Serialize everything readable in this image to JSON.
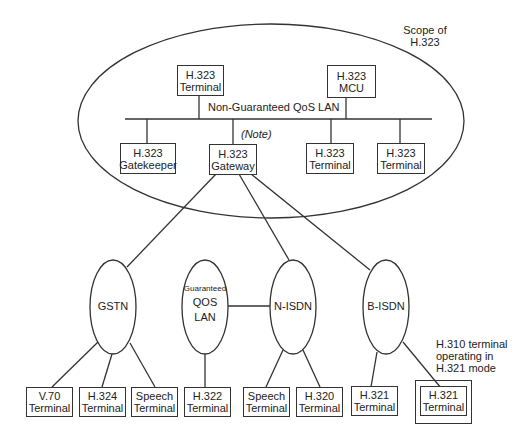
{
  "scope_label": {
    "line1": "Scope of",
    "line2": "H.323"
  },
  "lan_label": "Non-Guaranteed QoS LAN",
  "note_label": "(Note)",
  "h323_nodes": {
    "terminal_top": {
      "line1": "H.323",
      "line2": "Terminal"
    },
    "mcu": {
      "line1": "H.323",
      "line2": "MCU"
    },
    "gatekeeper": {
      "line1": "H.323",
      "line2": "Gatekeeper"
    },
    "gateway": {
      "line1": "H.323",
      "line2": "Gateway"
    },
    "terminal_a": {
      "line1": "H.323",
      "line2": "Terminal"
    },
    "terminal_b": {
      "line1": "H.323",
      "line2": "Terminal"
    }
  },
  "networks": {
    "gstn": "GSTN",
    "gqos": {
      "line1": "Guaranteed",
      "line2": "QOS",
      "line3": "LAN"
    },
    "nisdn": "N-ISDN",
    "bisdn": "B-ISDN"
  },
  "terminals": [
    {
      "line1": "V.70",
      "line2": "Terminal"
    },
    {
      "line1": "H.324",
      "line2": "Terminal"
    },
    {
      "line1": "Speech",
      "line2": "Terminal"
    },
    {
      "line1": "H.322",
      "line2": "Terminal"
    },
    {
      "line1": "Speech",
      "line2": "Terminal"
    },
    {
      "line1": "H.320",
      "line2": "Terminal"
    },
    {
      "line1": "H.321",
      "line2": "Terminal"
    },
    {
      "line1": "H.321",
      "line2": "Terminal"
    }
  ],
  "h310_label": {
    "line1": "H.310 terminal",
    "line2": "operating in",
    "line3": "H.321 mode"
  }
}
